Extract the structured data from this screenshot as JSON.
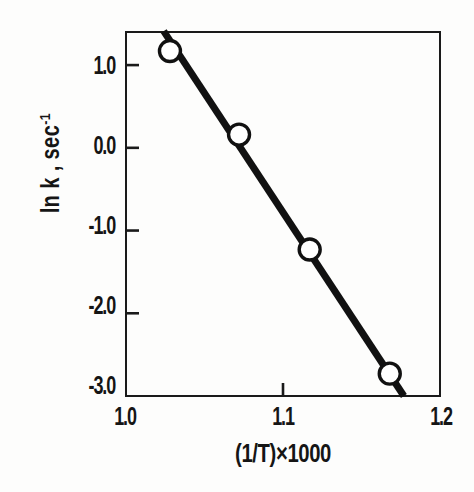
{
  "chart_data": {
    "type": "scatter",
    "title": "",
    "subtitle": "",
    "xlabel": "(1/T)×1000",
    "ylabel": "ln k , sec-1",
    "ylabel_base": "ln k , sec",
    "ylabel_exponent": "-1",
    "xlim": [
      1.0,
      1.2
    ],
    "ylim": [
      -3.0,
      1.4
    ],
    "xticks": [
      1.0,
      1.1,
      1.2
    ],
    "xtick_labels": [
      "1.0",
      "1.1",
      "1.2"
    ],
    "yticks": [
      1.0,
      0.0,
      -1.0,
      -2.0,
      -3.0
    ],
    "ytick_labels": [
      "1.0",
      "0.0",
      "-1.0",
      "-2.0",
      "-3.0"
    ],
    "grid": false,
    "legend": "none",
    "tick_direction": "in",
    "marker": "open-circle",
    "marker_face_color": "#ffffff",
    "marker_edge_color": "#111111",
    "line_color": "#111111",
    "frame_color": "#1a1a1a",
    "x": [
      1.028,
      1.072,
      1.117,
      1.168
    ],
    "y": [
      1.17,
      0.16,
      -1.23,
      -2.73
    ],
    "points": [
      {
        "x": 1.028,
        "y": 1.17
      },
      {
        "x": 1.072,
        "y": 0.16
      },
      {
        "x": 1.117,
        "y": 0.16
      },
      {
        "x": 1.168,
        "y": -2.73
      }
    ],
    "fit_line": {
      "x_start": 1.024,
      "y_start": 1.41,
      "x_end": 1.177,
      "y_end": -3.0,
      "slope": -28.8,
      "intercept": 30.9
    },
    "series": [
      {
        "name": "ln k vs (1/T)x1000",
        "x": [
          1.028,
          1.072,
          1.117,
          1.168
        ],
        "values": [
          1.17,
          0.16,
          -1.23,
          -2.73
        ]
      }
    ]
  }
}
